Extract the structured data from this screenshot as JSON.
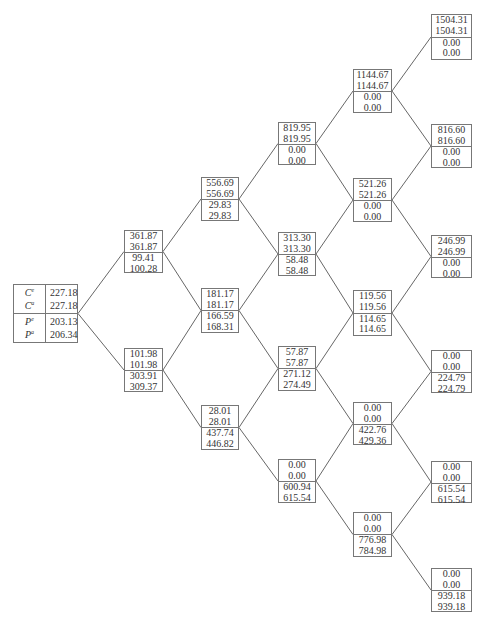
{
  "root": {
    "labels": [
      {
        "base": "C",
        "sup": "e"
      },
      {
        "base": "C",
        "sup": "a"
      },
      {
        "base": "P",
        "sup": "e"
      },
      {
        "base": "P",
        "sup": "a"
      }
    ],
    "values": [
      "227.18",
      "227.18",
      "203.13",
      "206.34"
    ]
  },
  "levels": [
    [
      {
        "c1": "361.87",
        "c2": "361.87",
        "p1": "99.41",
        "p2": "100.28"
      },
      {
        "c1": "101.98",
        "c2": "101.98",
        "p1": "303.91",
        "p2": "309.37"
      }
    ],
    [
      {
        "c1": "556.69",
        "c2": "556.69",
        "p1": "29.83",
        "p2": "29.83"
      },
      {
        "c1": "181.17",
        "c2": "181.17",
        "p1": "166.59",
        "p2": "168.31"
      },
      {
        "c1": "28.01",
        "c2": "28.01",
        "p1": "437.74",
        "p2": "446.82"
      }
    ],
    [
      {
        "c1": "819.95",
        "c2": "819.95",
        "p1": "0.00",
        "p2": "0.00"
      },
      {
        "c1": "313.30",
        "c2": "313.30",
        "p1": "58.48",
        "p2": "58.48"
      },
      {
        "c1": "57.87",
        "c2": "57.87",
        "p1": "271.12",
        "p2": "274.49"
      },
      {
        "c1": "0.00",
        "c2": "0.00",
        "p1": "600.94",
        "p2": "615.54"
      }
    ],
    [
      {
        "c1": "1144.67",
        "c2": "1144.67",
        "p1": "0.00",
        "p2": "0.00"
      },
      {
        "c1": "521.26",
        "c2": "521.26",
        "p1": "0.00",
        "p2": "0.00"
      },
      {
        "c1": "119.56",
        "c2": "119.56",
        "p1": "114.65",
        "p2": "114.65"
      },
      {
        "c1": "0.00",
        "c2": "0.00",
        "p1": "422.76",
        "p2": "429.36"
      },
      {
        "c1": "0.00",
        "c2": "0.00",
        "p1": "776.98",
        "p2": "784.98"
      }
    ],
    [
      {
        "c1": "1504.31",
        "c2": "1504.31",
        "p1": "0.00",
        "p2": "0.00"
      },
      {
        "c1": "816.60",
        "c2": "816.60",
        "p1": "0.00",
        "p2": "0.00"
      },
      {
        "c1": "246.99",
        "c2": "246.99",
        "p1": "0.00",
        "p2": "0.00"
      },
      {
        "c1": "0.00",
        "c2": "0.00",
        "p1": "224.79",
        "p2": "224.79"
      },
      {
        "c1": "0.00",
        "c2": "0.00",
        "p1": "615.54",
        "p2": "615.54"
      },
      {
        "c1": "0.00",
        "c2": "0.00",
        "p1": "939.18",
        "p2": "939.18"
      }
    ]
  ]
}
